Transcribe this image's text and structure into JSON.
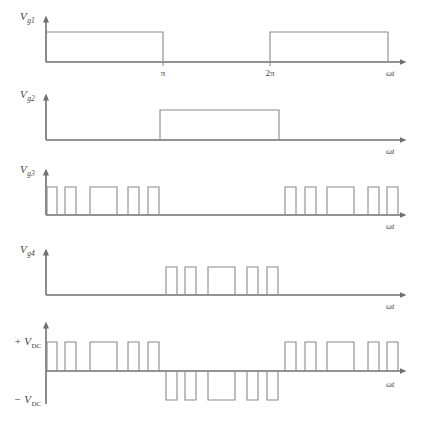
{
  "figure": {
    "background": "#ffffff",
    "line_color": "#8a8a8a",
    "axis_color": "#6f6f6f",
    "width": 424,
    "height": 439
  },
  "axis_label": "ωt",
  "tick_labels": {
    "pi": "π",
    "two_pi": "2π"
  },
  "panels": [
    {
      "id": "vg1",
      "label_main": "V",
      "label_sub": "g1",
      "axis_label": "ωt",
      "ticks": [
        {
          "text": "π",
          "x": 163
        },
        {
          "text": "2π",
          "x": 270
        }
      ],
      "pulses": [
        {
          "start": 46,
          "end": 163
        },
        {
          "start": 270,
          "end": 388
        }
      ]
    },
    {
      "id": "vg2",
      "label_main": "V",
      "label_sub": "g2",
      "axis_label": "ωt",
      "ticks": [],
      "pulses": [
        {
          "start": 160,
          "end": 279
        }
      ]
    },
    {
      "id": "vg3",
      "label_main": "V",
      "label_sub": "g3",
      "axis_label": "ωt",
      "ticks": [],
      "pulses": [
        {
          "start": 47,
          "end": 57
        },
        {
          "start": 65,
          "end": 76
        },
        {
          "start": 90,
          "end": 117
        },
        {
          "start": 128,
          "end": 139
        },
        {
          "start": 148,
          "end": 159
        },
        {
          "start": 285,
          "end": 296
        },
        {
          "start": 305,
          "end": 316
        },
        {
          "start": 327,
          "end": 354
        },
        {
          "start": 368,
          "end": 379
        },
        {
          "start": 387,
          "end": 398
        }
      ]
    },
    {
      "id": "vg4",
      "label_main": "V",
      "label_sub": "g4",
      "axis_label": "ωt",
      "ticks": [],
      "pulses": [
        {
          "start": 166,
          "end": 177
        },
        {
          "start": 185,
          "end": 196
        },
        {
          "start": 208,
          "end": 235
        },
        {
          "start": 247,
          "end": 258
        },
        {
          "start": 267,
          "end": 278
        }
      ]
    },
    {
      "id": "vout",
      "label_pos": "+ V",
      "label_pos_sub": "DC",
      "label_neg": "− V",
      "label_neg_sub": "DC",
      "axis_label": "ωt",
      "ticks": [],
      "pulses_positive": [
        {
          "start": 47,
          "end": 57
        },
        {
          "start": 65,
          "end": 76
        },
        {
          "start": 90,
          "end": 117
        },
        {
          "start": 128,
          "end": 139
        },
        {
          "start": 148,
          "end": 159
        },
        {
          "start": 285,
          "end": 296
        },
        {
          "start": 305,
          "end": 316
        },
        {
          "start": 327,
          "end": 354
        },
        {
          "start": 368,
          "end": 379
        },
        {
          "start": 387,
          "end": 398
        }
      ],
      "pulses_negative": [
        {
          "start": 166,
          "end": 177
        },
        {
          "start": 185,
          "end": 196
        },
        {
          "start": 208,
          "end": 235
        },
        {
          "start": 247,
          "end": 258
        },
        {
          "start": 267,
          "end": 278
        }
      ]
    }
  ],
  "geometry": {
    "axis_x": 46,
    "axis_right": 400,
    "panel_baselines": [
      62,
      140,
      215,
      295,
      371
    ],
    "pulse_height": 30,
    "pulse_height_small": 28,
    "axis_top_offset": 40,
    "vout_top": 340,
    "vout_bottom": 404
  }
}
